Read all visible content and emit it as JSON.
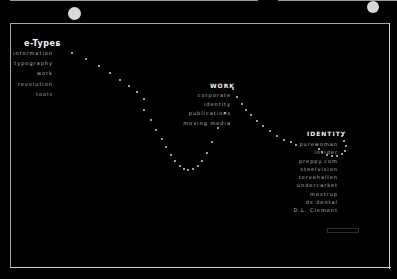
{
  "sections": {
    "etypes": {
      "title": "e-Types",
      "items": [
        "information",
        "typography",
        "work",
        "revolution",
        "tools"
      ]
    },
    "work": {
      "title": "WORK",
      "items": [
        "corporate",
        "identity",
        "publications",
        "moving media"
      ]
    },
    "identity": {
      "title": "IDENTITY",
      "items": [
        "purewoman",
        "insider",
        "preppy.com",
        "steelvision",
        "torvehallen",
        "undercarket",
        "mestrup",
        "ds dental",
        "D.L. Clement"
      ]
    },
    "colors": {
      "background": "#000000",
      "text": "#bcbcbc",
      "heading": "#f2f2f2",
      "border": "#a8a8a8",
      "dots": "#e6e6e6"
    }
  }
}
